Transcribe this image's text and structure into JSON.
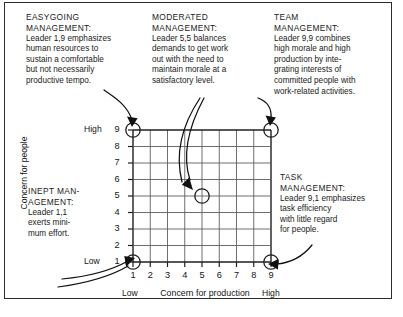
{
  "figure": {
    "border_color": "#2b2b2b"
  },
  "callouts": [
    {
      "id": "easygoing",
      "heading": "EASYGOING\nMANAGEMENT:",
      "body": "Leader 1,9 emphasizes\nhuman resources to\nsustain a comfortable\nbut not necessarily\nproductive tempo.",
      "points_to": "1,9"
    },
    {
      "id": "moderated",
      "heading": "MODERATED\nMANAGEMENT:",
      "body": "Leader 5,5 balances\ndemands to get work\nout with the need to\nmaintain morale at a\nsatisfactory level.",
      "points_to": "5,5"
    },
    {
      "id": "team",
      "heading": "TEAM\nMANAGEMENT:",
      "body": "Leader 9,9 combines\nhigh morale and high\nproduction by inte-\ngrating interests of\ncommitted people with\nwork-related activities.",
      "points_to": "9,9"
    },
    {
      "id": "inept",
      "heading": "INEPT MAN-\nAGEMENT:",
      "body": "Leader 1,1\nexerts mini-\nmum effort.",
      "points_to": "1,1"
    },
    {
      "id": "task",
      "heading": "TASK\nMANAGEMENT:",
      "body": "Leader 9,1 emphasizes\ntask efficiency\nwith little regard\nfor people.",
      "points_to": "9,1"
    }
  ],
  "chart_data": {
    "type": "scatter",
    "xlabel": "Concern for production",
    "ylabel": "Concern for people",
    "x_ticks": [
      "1",
      "2",
      "3",
      "4",
      "5",
      "6",
      "7",
      "8",
      "9"
    ],
    "y_ticks": [
      "1",
      "2",
      "3",
      "4",
      "5",
      "6",
      "7",
      "8",
      "9"
    ],
    "xlim": [
      1,
      9
    ],
    "ylim": [
      1,
      9
    ],
    "grid": true,
    "legend": "none",
    "x_low_label": "Low",
    "x_high_label": "High",
    "y_low_label": "Low",
    "y_high_label": "High",
    "points": [
      {
        "label": "1,9",
        "x": 1,
        "y": 9,
        "name": "Easygoing Management"
      },
      {
        "label": "9,9",
        "x": 9,
        "y": 9,
        "name": "Team Management"
      },
      {
        "label": "5,5",
        "x": 5,
        "y": 5,
        "name": "Moderated Management"
      },
      {
        "label": "1,1",
        "x": 1,
        "y": 1,
        "name": "Inept Management"
      },
      {
        "label": "9,1",
        "x": 9,
        "y": 1,
        "name": "Task Management"
      }
    ]
  }
}
